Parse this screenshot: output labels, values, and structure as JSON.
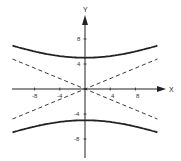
{
  "chart_data": {
    "type": "line",
    "title": "",
    "xlabel": "X",
    "ylabel": "Y",
    "x_ticks": [
      -8,
      -4,
      4,
      8
    ],
    "y_ticks": [
      8,
      4,
      -4,
      -8
    ],
    "xlim": [
      -12,
      13.5
    ],
    "ylim": [
      -11,
      11
    ],
    "grid": false,
    "legend": null,
    "series": [
      {
        "name": "hyperbola upper branch",
        "style": "solid",
        "equation": "y = 5*sqrt(1 + x^2/144)",
        "x": [
          -11.5,
          -8,
          -4,
          0,
          4,
          8,
          11.5
        ],
        "y": [
          6.9,
          6.0,
          5.3,
          5.0,
          5.3,
          6.0,
          6.9
        ]
      },
      {
        "name": "hyperbola lower branch",
        "style": "solid",
        "equation": "y = -5*sqrt(1 + x^2/144)",
        "x": [
          -11.5,
          -8,
          -4,
          0,
          4,
          8,
          11.5
        ],
        "y": [
          -6.9,
          -6.0,
          -5.3,
          -5.0,
          -5.3,
          -6.0,
          -6.9
        ]
      },
      {
        "name": "asymptote positive",
        "style": "dashed",
        "equation": "y = 5x/12",
        "x": [
          -11.5,
          11.5
        ],
        "y": [
          -4.8,
          4.8
        ]
      },
      {
        "name": "asymptote negative",
        "style": "dashed",
        "equation": "y = -5x/12",
        "x": [
          -11.5,
          11.5
        ],
        "y": [
          4.8,
          -4.8
        ]
      }
    ]
  },
  "labels": {
    "x_axis": "X",
    "y_axis": "Y",
    "x_tick_labels": [
      "-8",
      "-4",
      "4",
      "8"
    ],
    "y_tick_labels": [
      "8",
      "4",
      "-4",
      "-8"
    ]
  }
}
